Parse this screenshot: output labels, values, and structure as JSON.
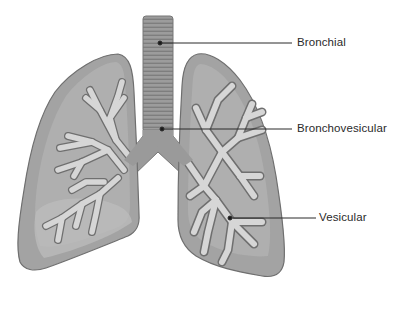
{
  "labels": [
    {
      "id": "bronchial",
      "text": "Bronchial",
      "x": 297,
      "y": 38
    },
    {
      "id": "bronchovesicular",
      "text": "Bronchovesicular",
      "x": 297,
      "y": 124
    },
    {
      "id": "vesicular",
      "text": "Vesicular",
      "x": 318,
      "y": 212
    }
  ],
  "colors": {
    "lung_fill": "#a2a2a2",
    "lung_inner": "#b6b6b6",
    "lung_outline": "#6f6f6f",
    "trachea_fill": "#9a9a9a",
    "trachea_stripe": "#7c7c7c",
    "bronchi_fill": "#d4d4d4",
    "leader_line": "#2a2a2a",
    "text": "#2a2a2a"
  }
}
